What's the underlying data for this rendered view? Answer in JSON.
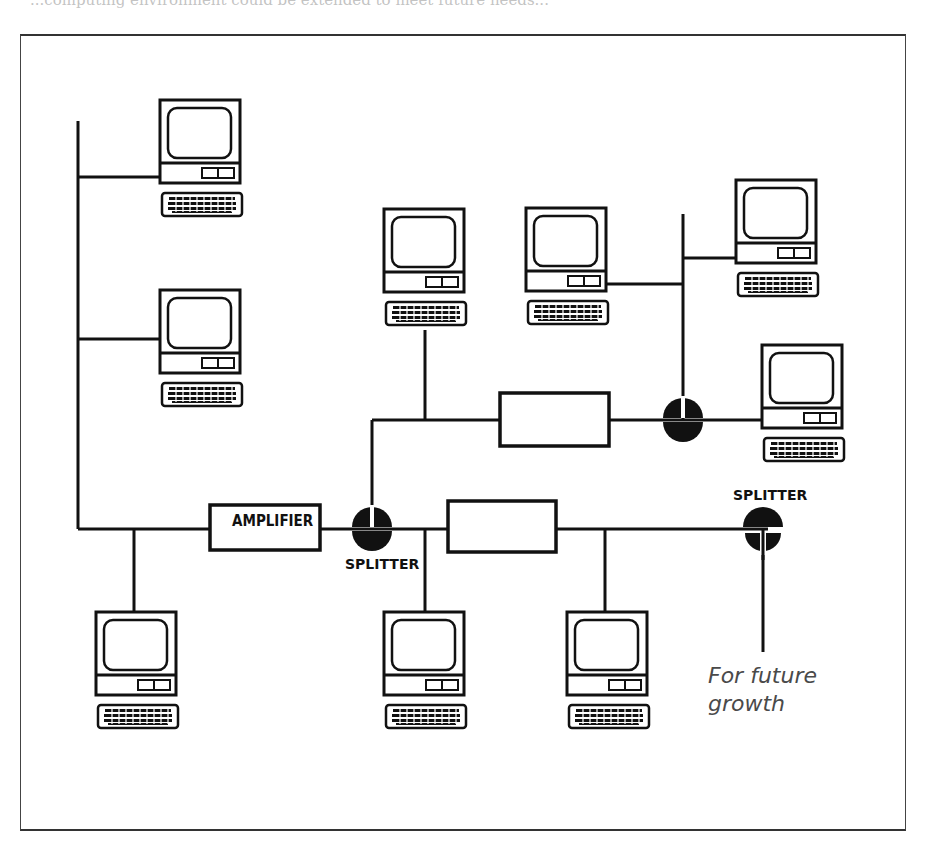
{
  "caption_fragment": "...computing environment could be extended to meet future needs...",
  "diagram": {
    "labels": {
      "amplifier": "AMPLIFIER",
      "splitter_main": "SPLITTER",
      "splitter_right": "SPLITTER",
      "future_line1": "For future",
      "future_line2": "growth"
    },
    "components": {
      "computers": 10,
      "amplifiers": 1,
      "unlabeled_boxes": 2,
      "splitters": 3
    },
    "colors": {
      "line": "#111111",
      "future_text": "#4a4a4a",
      "frame": "#333333"
    }
  }
}
